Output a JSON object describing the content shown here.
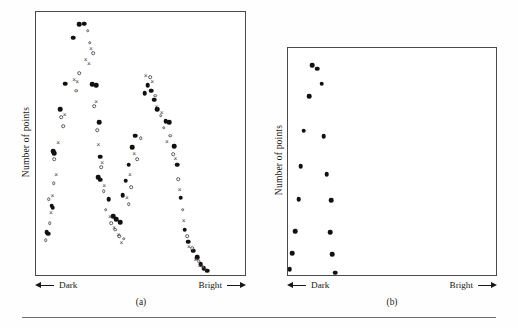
{
  "figure": {
    "background_color": "#ffffff",
    "ink_color": "#111111",
    "frame_color": "#4a4a4a",
    "rule_present": true
  },
  "panels": [
    {
      "id": "a",
      "caption": "(a)",
      "ylabel": "Number of points",
      "x_axis": {
        "left_label": "Dark",
        "right_label": "Bright",
        "left_arrow_icon": "arrow-left-icon",
        "right_arrow_icon": "arrow-right-icon"
      }
    },
    {
      "id": "b",
      "caption": "(b)",
      "ylabel": "Number of points",
      "x_axis": {
        "left_label": "Dark",
        "right_label": "Bright",
        "left_arrow_icon": "arrow-left-icon",
        "right_arrow_icon": "arrow-right-icon"
      }
    }
  ],
  "chart_data": [
    {
      "type": "scatter",
      "panel": "a",
      "title": "(a)",
      "xlabel": "Dark ← → Bright",
      "ylabel": "Number of points",
      "xlim": [
        0,
        100
      ],
      "ylim": [
        0,
        100
      ],
      "grid": false,
      "legend": "none",
      "marker_types": [
        "filled-circle",
        "open-circle",
        "cross"
      ],
      "note": "Bimodal distribution: two peaks near the dark end and a broad descending tail toward the bright end. Values are normalized percentages of the plot frame, y measured upward.",
      "series": [
        {
          "name": "filled-circle",
          "marker": "filled-circle",
          "points": [
            [
              21.0,
              95.0
            ],
            [
              23.4,
              95.2
            ],
            [
              18.0,
              90.0
            ],
            [
              14.4,
              72.5
            ],
            [
              27.0,
              72.3
            ],
            [
              29.0,
              72.0
            ],
            [
              12.0,
              63.0
            ],
            [
              30.5,
              58.0
            ],
            [
              8.5,
              47.0
            ],
            [
              9.2,
              46.3
            ],
            [
              31.0,
              45.0
            ],
            [
              30.0,
              37.2
            ],
            [
              30.8,
              36.4
            ],
            [
              8.0,
              26.5
            ],
            [
              8.4,
              25.8
            ],
            [
              5.6,
              16.5
            ],
            [
              6.2,
              16.0
            ],
            [
              35.0,
              29.0
            ],
            [
              37.0,
              22.5
            ],
            [
              38.4,
              21.5
            ],
            [
              40.5,
              20.2
            ],
            [
              41.5,
              30.5
            ],
            [
              43.0,
              36.0
            ],
            [
              44.5,
              42.0
            ],
            [
              46.0,
              48.5
            ],
            [
              47.5,
              53.0
            ],
            [
              52.0,
              69.0
            ],
            [
              53.5,
              72.0
            ],
            [
              55.0,
              70.0
            ],
            [
              56.5,
              66.5
            ],
            [
              58.0,
              63.0
            ],
            [
              62.0,
              58.5
            ],
            [
              63.5,
              58.0
            ],
            [
              66.0,
              49.0
            ],
            [
              67.5,
              42.0
            ],
            [
              69.0,
              29.5
            ],
            [
              71.0,
              17.5
            ],
            [
              72.5,
              13.0
            ],
            [
              75.0,
              9.5
            ],
            [
              77.0,
              7.0
            ],
            [
              78.5,
              4.5
            ],
            [
              80.0,
              3.0
            ],
            [
              81.5,
              2.0
            ]
          ]
        },
        {
          "name": "open-circle",
          "marker": "open-circle",
          "points": [
            [
              25.0,
              92.5
            ],
            [
              26.0,
              88.0
            ],
            [
              27.5,
              84.0
            ],
            [
              21.0,
              76.5
            ],
            [
              19.5,
              70.0
            ],
            [
              12.5,
              60.0
            ],
            [
              13.5,
              56.5
            ],
            [
              28.0,
              64.0
            ],
            [
              29.5,
              55.0
            ],
            [
              9.0,
              44.0
            ],
            [
              8.8,
              35.0
            ],
            [
              6.5,
              29.0
            ],
            [
              7.0,
              20.0
            ],
            [
              5.0,
              13.5
            ],
            [
              31.5,
              41.0
            ],
            [
              32.5,
              32.0
            ],
            [
              33.5,
              25.0
            ],
            [
              36.0,
              20.0
            ],
            [
              38.0,
              17.5
            ],
            [
              40.0,
              15.0
            ],
            [
              42.0,
              14.0
            ],
            [
              44.5,
              27.0
            ],
            [
              45.5,
              33.5
            ],
            [
              48.5,
              44.0
            ],
            [
              50.0,
              52.0
            ],
            [
              54.5,
              75.0
            ],
            [
              57.0,
              68.0
            ],
            [
              59.5,
              60.5
            ],
            [
              61.0,
              56.0
            ],
            [
              64.0,
              53.0
            ],
            [
              65.5,
              46.0
            ],
            [
              68.0,
              36.5
            ],
            [
              70.0,
              25.0
            ],
            [
              72.0,
              15.0
            ],
            [
              74.5,
              10.5
            ],
            [
              77.5,
              5.5
            ],
            [
              79.5,
              3.5
            ]
          ]
        },
        {
          "name": "cross",
          "marker": "cross",
          "points": [
            [
              26.5,
              86.0
            ],
            [
              24.0,
              82.0
            ],
            [
              25.5,
              80.5
            ],
            [
              18.5,
              74.5
            ],
            [
              20.0,
              73.5
            ],
            [
              14.0,
              61.0
            ],
            [
              11.0,
              50.5
            ],
            [
              10.0,
              38.5
            ],
            [
              8.2,
              30.5
            ],
            [
              7.5,
              24.0
            ],
            [
              29.0,
              66.0
            ],
            [
              30.0,
              50.0
            ],
            [
              31.8,
              43.0
            ],
            [
              32.8,
              34.5
            ],
            [
              35.5,
              22.5
            ],
            [
              37.5,
              18.5
            ],
            [
              39.5,
              16.0
            ],
            [
              41.0,
              13.0
            ],
            [
              43.5,
              30.0
            ],
            [
              45.0,
              38.5
            ],
            [
              47.0,
              46.5
            ],
            [
              52.5,
              76.0
            ],
            [
              55.5,
              73.5
            ],
            [
              57.5,
              64.0
            ],
            [
              60.0,
              62.0
            ],
            [
              62.5,
              51.0
            ],
            [
              66.5,
              44.5
            ],
            [
              68.5,
              33.0
            ],
            [
              70.5,
              21.0
            ],
            [
              73.0,
              11.5
            ],
            [
              76.0,
              6.5
            ],
            [
              78.0,
              4.0
            ],
            [
              80.5,
              2.5
            ]
          ]
        }
      ]
    },
    {
      "type": "scatter",
      "panel": "b",
      "title": "(b)",
      "xlabel": "Dark ← → Bright",
      "ylabel": "Number of points",
      "xlim": [
        0,
        100
      ],
      "ylim": [
        0,
        100
      ],
      "grid": false,
      "legend": "none",
      "marker_types": [
        "filled-circle"
      ],
      "note": "Single marker type. Two converging limbs forming a narrow V confined to the dark end of the axis.",
      "series": [
        {
          "name": "filled-circle",
          "marker": "filled-circle",
          "points": [
            [
              12.0,
              92.0
            ],
            [
              14.5,
              90.5
            ],
            [
              16.5,
              84.0
            ],
            [
              10.5,
              78.5
            ],
            [
              8.0,
              63.5
            ],
            [
              17.5,
              61.0
            ],
            [
              6.5,
              48.0
            ],
            [
              19.0,
              44.5
            ],
            [
              5.5,
              33.5
            ],
            [
              21.0,
              33.0
            ],
            [
              4.0,
              19.5
            ],
            [
              20.5,
              19.0
            ],
            [
              2.5,
              10.0
            ],
            [
              21.5,
              9.5
            ],
            [
              1.2,
              3.0
            ],
            [
              23.0,
              1.5
            ]
          ]
        }
      ]
    }
  ]
}
